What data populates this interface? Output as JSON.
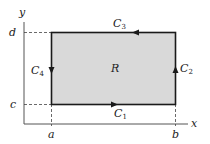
{
  "diagram": {
    "axes": {
      "x_label": "x",
      "y_label": "y"
    },
    "ticks": {
      "x": [
        {
          "label": "a"
        },
        {
          "label": "b"
        }
      ],
      "y": [
        {
          "label": "c"
        },
        {
          "label": "d"
        }
      ]
    },
    "region": {
      "label": "R",
      "fill_color": "#d9d9d9",
      "edge_color": "#1a1a1a"
    },
    "curves": [
      {
        "id": "C1",
        "base": "C",
        "sub": "1",
        "side": "bottom",
        "direction": "right"
      },
      {
        "id": "C2",
        "base": "C",
        "sub": "2",
        "side": "right",
        "direction": "up"
      },
      {
        "id": "C3",
        "base": "C",
        "sub": "3",
        "side": "top",
        "direction": "left"
      },
      {
        "id": "C4",
        "base": "C",
        "sub": "4",
        "side": "left",
        "direction": "down"
      }
    ],
    "orientation": "counterclockwise"
  }
}
